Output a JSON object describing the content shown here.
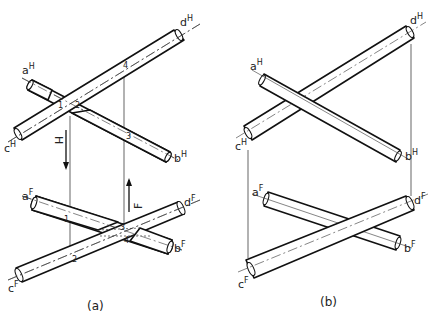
{
  "figure": {
    "panel_a": {
      "caption": "(a)",
      "horizontal_view": {
        "labels": {
          "a": {
            "base": "a",
            "sup": "H"
          },
          "b": {
            "base": "b",
            "sup": "H"
          },
          "c": {
            "base": "c",
            "sup": "H"
          },
          "d": {
            "base": "d",
            "sup": "H"
          }
        },
        "points": [
          "1",
          "2",
          "3",
          "4"
        ],
        "arrow_label": "H"
      },
      "frontal_view": {
        "labels": {
          "a": {
            "base": "a",
            "sup": "F"
          },
          "b": {
            "base": "b",
            "sup": "F"
          },
          "c": {
            "base": "c",
            "sup": "F"
          },
          "d": {
            "base": "d",
            "sup": "F"
          }
        },
        "points": [
          "1",
          "2",
          "3",
          "4"
        ],
        "arrow_label": "F"
      }
    },
    "panel_b": {
      "caption": "(b)",
      "horizontal_view": {
        "labels": {
          "a": {
            "base": "a",
            "sup": "H"
          },
          "b": {
            "base": "b",
            "sup": "H"
          },
          "c": {
            "base": "c",
            "sup": "H"
          },
          "d": {
            "base": "d",
            "sup": "H"
          }
        }
      },
      "frontal_view": {
        "labels": {
          "a": {
            "base": "a",
            "sup": "F"
          },
          "b": {
            "base": "b",
            "sup": "F"
          },
          "c": {
            "base": "c",
            "sup": "F"
          },
          "d": {
            "base": "d",
            "sup": "F"
          }
        }
      }
    }
  }
}
